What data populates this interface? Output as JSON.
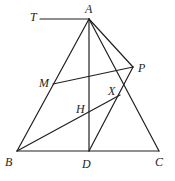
{
  "figure": {
    "width": 175,
    "height": 181,
    "stroke_color": "#231f20",
    "points": {
      "T": {
        "label": "T",
        "x": 40,
        "y": 19,
        "lx": 30,
        "ly": 21
      },
      "A": {
        "label": "A",
        "x": 89,
        "y": 19,
        "lx": 85,
        "ly": 13
      },
      "B": {
        "label": "B",
        "x": 17,
        "y": 151,
        "lx": 5,
        "ly": 166
      },
      "C": {
        "label": "C",
        "x": 159,
        "y": 151,
        "lx": 155,
        "ly": 166
      },
      "D": {
        "label": "D",
        "x": 89,
        "y": 151,
        "lx": 82,
        "ly": 168
      },
      "M": {
        "label": "M",
        "x": 53,
        "y": 84,
        "lx": 39,
        "ly": 87
      },
      "P": {
        "label": "P",
        "x": 133,
        "y": 67,
        "lx": 138,
        "ly": 72
      },
      "X": {
        "label": "X",
        "x": 120,
        "y": 95,
        "lx": 108,
        "ly": 95
      },
      "H": {
        "label": "H",
        "x": 89,
        "y": 117,
        "lx": 76,
        "ly": 113
      }
    },
    "segments": [
      {
        "name": "segment-TA",
        "from": "T",
        "to": "A"
      },
      {
        "name": "segment-AB",
        "from": "A",
        "to": "B"
      },
      {
        "name": "segment-AC",
        "from": "A",
        "to": "C"
      },
      {
        "name": "segment-AD",
        "from": "A",
        "to": "D"
      },
      {
        "name": "segment-BC",
        "from": "B",
        "to": "C"
      },
      {
        "name": "segment-AP",
        "from": "A",
        "to": "P"
      },
      {
        "name": "segment-MP",
        "from": "M",
        "to": "P"
      },
      {
        "name": "segment-PD",
        "from": "P",
        "to": "D"
      },
      {
        "name": "segment-BX",
        "from": "B",
        "to": "X"
      }
    ]
  }
}
